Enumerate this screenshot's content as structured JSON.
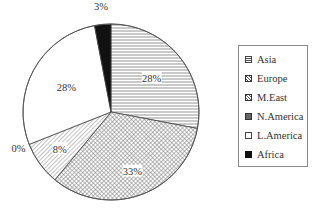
{
  "chart_data": {
    "type": "pie",
    "title": "",
    "categories": [
      "Asia",
      "Europe",
      "M.East",
      "N.America",
      "L.America",
      "Africa"
    ],
    "values": [
      28,
      8,
      33,
      0,
      28,
      3
    ],
    "value_labels": [
      "28%",
      "8%",
      "33%",
      "0%",
      "28%",
      "3%"
    ],
    "units": "%",
    "start_angle_deg": 0,
    "direction": "clockwise",
    "draw_order": [
      "Asia",
      "M.East",
      "Europe",
      "N.America",
      "L.America",
      "Africa"
    ],
    "legend_position": "right",
    "fills": {
      "Asia": "horizontal-lines",
      "Europe": "diagonal-lines",
      "M.East": "crosshatch-checker",
      "N.America": "dark-gray-solid",
      "L.America": "white",
      "Africa": "black-solid"
    }
  },
  "legend": {
    "items": [
      {
        "label": "Asia"
      },
      {
        "label": "Europe"
      },
      {
        "label": "M.East"
      },
      {
        "label": "N.America"
      },
      {
        "label": "L.America"
      },
      {
        "label": "Africa"
      }
    ]
  }
}
